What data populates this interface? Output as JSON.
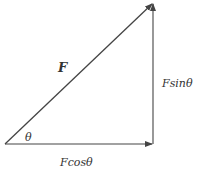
{
  "diagram": {
    "type": "force-vector-decomposition",
    "labels": {
      "force": "F",
      "vertical_component": "Fsinθ",
      "horizontal_component": "Fcosθ",
      "angle": "θ"
    },
    "colors": {
      "line": "#444444",
      "text": "#333333",
      "background": "#ffffff"
    }
  }
}
